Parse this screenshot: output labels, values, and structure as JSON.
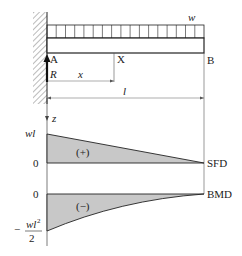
{
  "diagram": {
    "type": "cantilever-beam-sfd-bmd",
    "beam": {
      "support_label": "A",
      "free_end_label": "B",
      "section_label": "X",
      "load_label": "w",
      "reaction_label": "R",
      "distance_label": "x",
      "length_label": "l",
      "axis_label": "z"
    },
    "sfd": {
      "name": "SFD",
      "max_label": "wl",
      "zero_label": "0",
      "sign": "(+)"
    },
    "bmd": {
      "name": "BMD",
      "zero_label": "0",
      "min_label_prefix": "−",
      "min_label_num": "wl",
      "min_label_exp": "2",
      "min_label_den": "2",
      "sign": "(−)"
    },
    "colors": {
      "line": "#222222",
      "fill": "#c8c8c8",
      "thin": "#555555"
    }
  }
}
